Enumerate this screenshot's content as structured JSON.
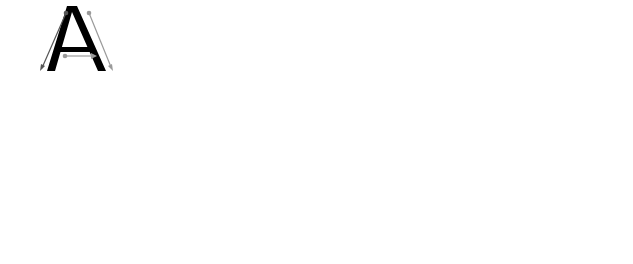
{
  "worksheet": {
    "letter": "A",
    "colors": {
      "line": "#a8a8a8",
      "baseline": "#8c8c8c",
      "dot": "#555555",
      "letter": "#000000",
      "arrow_dark": "#555555",
      "arrow_light": "#9a9a9a",
      "trace": "#000000"
    },
    "row1": {
      "lines_y": [
        5,
        36,
        70,
        101
      ],
      "model_letter": {
        "x": 77,
        "label": "A"
      },
      "trace_letters_x": [
        196,
        313,
        432
      ],
      "start_dots_x": [
        196,
        313,
        432,
        550
      ]
    },
    "row2": {
      "lines_y": [
        157,
        188,
        222,
        254
      ],
      "start_dots_x": [
        78,
        196,
        313,
        432,
        550
      ]
    }
  }
}
